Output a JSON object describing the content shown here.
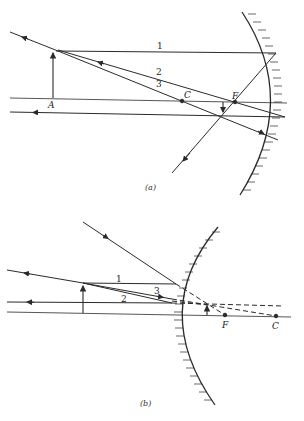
{
  "figure_a": {
    "caption": "(a)",
    "mirror_type": "concave",
    "labels": {
      "object_base": "A",
      "center": "C",
      "focus": "F",
      "ray1": "1",
      "ray2": "2",
      "ray3": "3"
    }
  },
  "figure_b": {
    "caption": "(b)",
    "mirror_type": "convex",
    "labels": {
      "focus": "F",
      "center": "C",
      "ray1": "1",
      "ray2": "2",
      "ray3": "3"
    }
  },
  "colors": {
    "line": "#2a2a2a",
    "background": "#ffffff"
  }
}
